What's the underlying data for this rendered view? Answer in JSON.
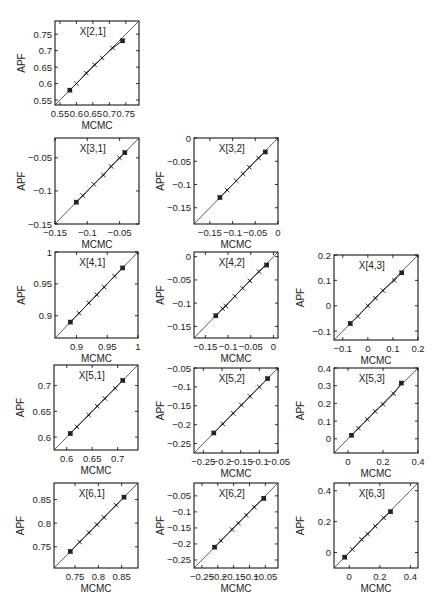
{
  "figure": {
    "xlabel": "MCMC",
    "ylabel": "APF"
  },
  "chart_data": [
    {
      "type": "scatter",
      "title": "X[2,1]",
      "xlabel": "MCMC",
      "ylabel": "APF",
      "xlim": [
        0.535,
        0.79
      ],
      "ylim": [
        0.535,
        0.79
      ],
      "xticks": [
        0.55,
        0.6,
        0.65,
        0.7,
        0.75
      ],
      "xticklabels": [
        "0.55",
        "0.6",
        "0.65",
        "0.7",
        "0.75"
      ],
      "yticks": [
        0.55,
        0.6,
        0.65,
        0.7,
        0.75
      ],
      "yticklabels": [
        "0.55",
        "0.6",
        "0.65",
        "0.7",
        "0.75"
      ],
      "diagonal": true,
      "points": [
        [
          0.58,
          0.58
        ],
        [
          0.6,
          0.6
        ],
        [
          0.63,
          0.632
        ],
        [
          0.655,
          0.657
        ],
        [
          0.678,
          0.678
        ],
        [
          0.71,
          0.708
        ],
        [
          0.74,
          0.73
        ]
      ],
      "box": [
        55,
        21,
        84,
        84
      ]
    },
    {
      "type": "scatter",
      "title": "X[3,1]",
      "xlabel": "MCMC",
      "ylabel": "APF",
      "xlim": [
        -0.15,
        -0.02
      ],
      "ylim": [
        -0.15,
        -0.02
      ],
      "xticks": [
        -0.15,
        -0.1,
        -0.05
      ],
      "xticklabels": [
        "-0.15",
        "-0.1",
        "-0.05"
      ],
      "yticks": [
        -0.15,
        -0.1,
        -0.05
      ],
      "yticklabels": [
        "-0.15",
        "-0.1",
        "-0.05"
      ],
      "diagonal": true,
      "points": [
        [
          -0.117,
          -0.117
        ],
        [
          -0.107,
          -0.107
        ],
        [
          -0.09,
          -0.09
        ],
        [
          -0.075,
          -0.076
        ],
        [
          -0.063,
          -0.063
        ],
        [
          -0.05,
          -0.05
        ],
        [
          -0.042,
          -0.042
        ]
      ],
      "box": [
        55,
        138,
        84,
        86
      ]
    },
    {
      "type": "scatter",
      "title": "X[3,2]",
      "xlabel": "MCMC",
      "ylabel": "APF",
      "xlim": [
        -0.185,
        0
      ],
      "ylim": [
        -0.185,
        0
      ],
      "xticks": [
        -0.15,
        -0.1,
        -0.05,
        0
      ],
      "xticklabels": [
        "-0.15",
        "-0.1",
        "-0.05",
        "0"
      ],
      "yticks": [
        -0.15,
        -0.1,
        -0.05,
        0
      ],
      "yticklabels": [
        "-0.15",
        "-0.1",
        "-0.05",
        "0"
      ],
      "diagonal": true,
      "points": [
        [
          -0.128,
          -0.128
        ],
        [
          -0.112,
          -0.112
        ],
        [
          -0.092,
          -0.092
        ],
        [
          -0.077,
          -0.077
        ],
        [
          -0.063,
          -0.063
        ],
        [
          -0.043,
          -0.043
        ],
        [
          -0.028,
          -0.03
        ]
      ],
      "box": [
        194,
        138,
        84,
        86
      ]
    },
    {
      "type": "scatter",
      "title": "X[4,1]",
      "xlabel": "MCMC",
      "ylabel": "APF",
      "xlim": [
        0.865,
        1.0
      ],
      "ylim": [
        0.865,
        1.0
      ],
      "xticks": [
        0.9,
        0.95,
        1
      ],
      "xticklabels": [
        "0.9",
        "0.95",
        "1"
      ],
      "yticks": [
        0.9,
        0.95,
        1
      ],
      "yticklabels": [
        "0.9",
        "0.95",
        "1"
      ],
      "diagonal": true,
      "points": [
        [
          0.89,
          0.89
        ],
        [
          0.904,
          0.904
        ],
        [
          0.92,
          0.92
        ],
        [
          0.933,
          0.933
        ],
        [
          0.945,
          0.945
        ],
        [
          0.962,
          0.962
        ],
        [
          0.975,
          0.975
        ]
      ],
      "box": [
        55,
        252,
        83,
        86
      ]
    },
    {
      "type": "scatter",
      "title": "X[4,2]",
      "xlabel": "MCMC",
      "ylabel": "APF",
      "xlim": [
        -0.175,
        0.01
      ],
      "ylim": [
        -0.175,
        0.01
      ],
      "xticks": [
        -0.15,
        -0.1,
        -0.05,
        0
      ],
      "xticklabels": [
        "-0.15",
        "-0.1",
        "-0.05",
        "0"
      ],
      "yticks": [
        -0.15,
        -0.1,
        -0.05,
        0
      ],
      "yticklabels": [
        "-0.15",
        "-0.1",
        "-0.05",
        "0"
      ],
      "diagonal": true,
      "points": [
        [
          -0.127,
          -0.127
        ],
        [
          -0.112,
          -0.112
        ],
        [
          -0.105,
          -0.106
        ],
        [
          -0.085,
          -0.085
        ],
        [
          -0.068,
          -0.068
        ],
        [
          -0.052,
          -0.052
        ],
        [
          -0.032,
          -0.032
        ],
        [
          -0.015,
          -0.018
        ]
      ],
      "box": [
        194,
        252,
        84,
        86
      ]
    },
    {
      "type": "scatter",
      "title": "X[4,3]",
      "xlabel": "MCMC",
      "ylabel": "APF",
      "xlim": [
        -0.135,
        0.2
      ],
      "ylim": [
        -0.135,
        0.2
      ],
      "xticks": [
        -0.1,
        0,
        0.1,
        0.2
      ],
      "xticklabels": [
        "-0.1",
        "0",
        "0.1",
        "0.2"
      ],
      "yticks": [
        -0.1,
        0,
        0.1,
        0.2
      ],
      "yticklabels": [
        "-0.1",
        "0",
        "0.1",
        "0.2"
      ],
      "diagonal": true,
      "points": [
        [
          -0.07,
          -0.07
        ],
        [
          -0.04,
          -0.042
        ],
        [
          0.0,
          0.0
        ],
        [
          0.03,
          0.03
        ],
        [
          0.06,
          0.06
        ],
        [
          0.105,
          0.1
        ],
        [
          0.135,
          0.13
        ]
      ],
      "box": [
        334,
        255,
        84,
        85
      ]
    },
    {
      "type": "scatter",
      "title": "X[5,1]",
      "xlabel": "MCMC",
      "ylabel": "APF",
      "xlim": [
        0.575,
        0.74
      ],
      "ylim": [
        0.575,
        0.74
      ],
      "xticks": [
        0.6,
        0.65,
        0.7
      ],
      "xticklabels": [
        "0.6",
        "0.65",
        "0.7"
      ],
      "yticks": [
        0.6,
        0.65,
        0.7
      ],
      "yticklabels": [
        "0.6",
        "0.65",
        "0.7"
      ],
      "diagonal": true,
      "points": [
        [
          0.607,
          0.607
        ],
        [
          0.62,
          0.62
        ],
        [
          0.643,
          0.643
        ],
        [
          0.66,
          0.66
        ],
        [
          0.675,
          0.675
        ],
        [
          0.695,
          0.695
        ],
        [
          0.71,
          0.71
        ]
      ],
      "box": [
        54,
        365,
        84,
        85
      ]
    },
    {
      "type": "scatter",
      "title": "X[5,2]",
      "xlabel": "MCMC",
      "ylabel": "APF",
      "xlim": [
        -0.275,
        -0.05
      ],
      "ylim": [
        -0.275,
        -0.05
      ],
      "xticks": [
        -0.25,
        -0.2,
        -0.15,
        -0.1,
        -0.05
      ],
      "xticklabels": [
        "-0.25",
        "-0.2",
        "-0.15",
        "-0.1",
        "-0.05"
      ],
      "yticks": [
        -0.25,
        -0.2,
        -0.15,
        -0.1,
        -0.05
      ],
      "yticklabels": [
        "-0.25",
        "-0.2",
        "-0.15",
        "-0.1",
        "-0.05"
      ],
      "diagonal": true,
      "points": [
        [
          -0.222,
          -0.222
        ],
        [
          -0.198,
          -0.198
        ],
        [
          -0.17,
          -0.17
        ],
        [
          -0.148,
          -0.148
        ],
        [
          -0.125,
          -0.125
        ],
        [
          -0.1,
          -0.1
        ],
        [
          -0.078,
          -0.078
        ]
      ],
      "box": [
        194,
        368,
        84,
        85
      ]
    },
    {
      "type": "scatter",
      "title": "X[5,3]",
      "xlabel": "MCMC",
      "ylabel": "APF",
      "xlim": [
        -0.08,
        0.4
      ],
      "ylim": [
        -0.08,
        0.4
      ],
      "xticks": [
        0,
        0.2,
        0.4
      ],
      "xticklabels": [
        "0",
        "0.2",
        "0.4"
      ],
      "yticks": [
        0,
        0.1,
        0.2,
        0.3,
        0.4
      ],
      "yticklabels": [
        "0",
        "0.1",
        "0.2",
        "0.3",
        "0.4"
      ],
      "diagonal": true,
      "points": [
        [
          0.02,
          0.02
        ],
        [
          0.06,
          0.06
        ],
        [
          0.11,
          0.11
        ],
        [
          0.155,
          0.155
        ],
        [
          0.2,
          0.195
        ],
        [
          0.26,
          0.255
        ],
        [
          0.305,
          0.315
        ]
      ],
      "box": [
        334,
        368,
        84,
        85
      ]
    },
    {
      "type": "scatter",
      "title": "X[6,1]",
      "xlabel": "MCMC",
      "ylabel": "APF",
      "xlim": [
        0.705,
        0.885
      ],
      "ylim": [
        0.705,
        0.885
      ],
      "xticks": [
        0.75,
        0.8,
        0.85
      ],
      "xticklabels": [
        "0.75",
        "0.8",
        "0.85"
      ],
      "yticks": [
        0.75,
        0.8,
        0.85
      ],
      "yticklabels": [
        "0.75",
        "0.8",
        "0.85"
      ],
      "diagonal": true,
      "points": [
        [
          0.74,
          0.74
        ],
        [
          0.76,
          0.76
        ],
        [
          0.78,
          0.78
        ],
        [
          0.797,
          0.797
        ],
        [
          0.812,
          0.812
        ],
        [
          0.838,
          0.838
        ],
        [
          0.855,
          0.855
        ]
      ],
      "box": [
        54,
        483,
        84,
        85
      ]
    },
    {
      "type": "scatter",
      "title": "X[6,2]",
      "xlabel": "MCMC",
      "ylabel": "APF",
      "xlim": [
        -0.275,
        -0.01
      ],
      "ylim": [
        -0.275,
        -0.01
      ],
      "xticks": [
        -0.25,
        -0.2,
        -0.15,
        -0.1,
        -0.05
      ],
      "xticklabels": [
        "-0.25",
        "-0.2",
        "-0.15",
        "-0.1",
        "-0.05"
      ],
      "yticks": [
        -0.25,
        -0.2,
        -0.15,
        -0.1,
        -0.05
      ],
      "yticklabels": [
        "-0.25",
        "-0.2",
        "-0.15",
        "-0.1",
        "-0.05"
      ],
      "diagonal": true,
      "points": [
        [
          -0.21,
          -0.21
        ],
        [
          -0.19,
          -0.19
        ],
        [
          -0.155,
          -0.155
        ],
        [
          -0.135,
          -0.135
        ],
        [
          -0.11,
          -0.11
        ],
        [
          -0.085,
          -0.085
        ],
        [
          -0.055,
          -0.058
        ]
      ],
      "box": [
        194,
        483,
        84,
        85
      ]
    },
    {
      "type": "scatter",
      "title": "X[6,3]",
      "xlabel": "MCMC",
      "ylabel": "APF",
      "xlim": [
        -0.1,
        0.45
      ],
      "ylim": [
        -0.1,
        0.45
      ],
      "xticks": [
        0,
        0.2,
        0.4
      ],
      "xticklabels": [
        "0",
        "0.2",
        "0.4"
      ],
      "yticks": [
        0,
        0.2,
        0.4
      ],
      "yticklabels": [
        "0",
        "0.2",
        "0.4"
      ],
      "diagonal": true,
      "points": [
        [
          -0.03,
          -0.03
        ],
        [
          0.02,
          0.02
        ],
        [
          0.08,
          0.085
        ],
        [
          0.12,
          0.12
        ],
        [
          0.17,
          0.17
        ],
        [
          0.225,
          0.225
        ],
        [
          0.27,
          0.265
        ]
      ],
      "box": [
        334,
        483,
        84,
        85
      ]
    }
  ]
}
